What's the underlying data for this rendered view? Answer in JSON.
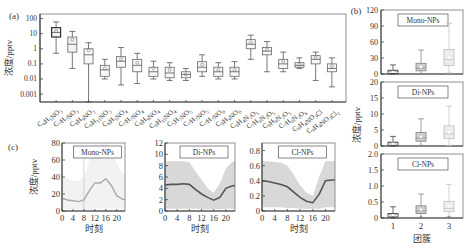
{
  "chart_data": [
    {
      "panel": "(a)",
      "type": "box",
      "ylabel": "浓度/pptv",
      "yscale": "log",
      "yticks": [
        "100",
        "10",
        "1",
        "0.1",
        "0.01",
        "0.001"
      ],
      "ylim": [
        0.0003,
        200
      ],
      "categories": [
        "C6H5NO3",
        "C7H7NO3",
        "C8H9NO3",
        "C6H11NO3",
        "C6H5NO4",
        "C7H7NO4",
        "C8H9NO4",
        "C6H11NO4",
        "C5H7NO5",
        "C7H7NO5",
        "C7H7NO6",
        "C8H9NO6",
        "C6H4N2O5",
        "C7H6N2O5",
        "C8H8N2O5",
        "C7H6N2O6",
        "C6H4NO3Cl",
        "C6H4NO3Cl2"
      ],
      "boxes": [
        {
          "min": 0.5,
          "q1": 6,
          "median": 12,
          "q3": 25,
          "max": 60,
          "mean": 15
        },
        {
          "min": 0.05,
          "q1": 0.6,
          "median": 2,
          "q3": 6,
          "max": 14,
          "mean": 4
        },
        {
          "min": 0.0003,
          "q1": 0.1,
          "median": 0.4,
          "q3": 1,
          "max": 2.5,
          "mean": 0.8
        },
        {
          "min": 0.01,
          "q1": 0.015,
          "median": 0.04,
          "q3": 0.08,
          "max": 0.2,
          "mean": 0.05
        },
        {
          "min": 0.004,
          "q1": 0.06,
          "median": 0.15,
          "q3": 0.3,
          "max": 1.2,
          "mean": 0.2
        },
        {
          "min": 0.005,
          "q1": 0.03,
          "median": 0.08,
          "q3": 0.2,
          "max": 0.5,
          "mean": 0.12
        },
        {
          "min": 0.01,
          "q1": 0.015,
          "median": 0.03,
          "q3": 0.06,
          "max": 0.15,
          "mean": 0.05
        },
        {
          "min": 0.008,
          "q1": 0.012,
          "median": 0.025,
          "q3": 0.06,
          "max": 0.12,
          "mean": 0.04
        },
        {
          "min": 0.008,
          "q1": 0.012,
          "median": 0.02,
          "q3": 0.03,
          "max": 0.05,
          "mean": 0.02
        },
        {
          "min": 0.015,
          "q1": 0.03,
          "median": 0.06,
          "q3": 0.14,
          "max": 0.4,
          "mean": 0.09
        },
        {
          "min": 0.01,
          "q1": 0.015,
          "median": 0.03,
          "q3": 0.06,
          "max": 0.12,
          "mean": 0.04
        },
        {
          "min": 0.01,
          "q1": 0.015,
          "median": 0.03,
          "q3": 0.06,
          "max": 0.14,
          "mean": 0.04
        },
        {
          "min": 0.2,
          "q1": 1,
          "median": 2,
          "q3": 4,
          "max": 8,
          "mean": 2.5
        },
        {
          "min": 0.03,
          "q1": 0.4,
          "median": 0.7,
          "q3": 1.2,
          "max": 3,
          "mean": 0.9
        },
        {
          "min": 0.03,
          "q1": 0.05,
          "median": 0.1,
          "q3": 0.2,
          "max": 0.6,
          "mean": 0.15
        },
        {
          "min": 0.05,
          "q1": 0.06,
          "median": 0.08,
          "q3": 0.12,
          "max": 0.25,
          "mean": 0.09
        },
        {
          "min": 0.008,
          "q1": 0.1,
          "median": 0.2,
          "q3": 0.35,
          "max": 0.6,
          "mean": 0.25
        },
        {
          "min": 0.003,
          "q1": 0.03,
          "median": 0.05,
          "q3": 0.1,
          "max": 0.25,
          "mean": 0.07
        }
      ]
    },
    {
      "panel": "(b)",
      "type": "box",
      "xlabel": "团簇",
      "ylabel": "浓度/pptv",
      "categories": [
        "1",
        "2",
        "3"
      ],
      "subplots": [
        {
          "label": "Mono-NPs",
          "yticks": [
            "0",
            "30",
            "60",
            "90",
            "120"
          ],
          "ylim": [
            0,
            120
          ],
          "boxes": [
            {
              "min": 0,
              "q1": 1,
              "median": 3,
              "q3": 7,
              "max": 17
            },
            {
              "min": 0,
              "q1": 6,
              "median": 11,
              "q3": 20,
              "max": 45
            },
            {
              "min": 2,
              "q1": 16,
              "median": 27,
              "q3": 46,
              "max": 95
            }
          ]
        },
        {
          "label": "Di-NPs",
          "yticks": [
            "0",
            "5",
            "10",
            "15",
            "20"
          ],
          "ylim": [
            0,
            20
          ],
          "boxes": [
            {
              "min": 0,
              "q1": 0.2,
              "median": 0.6,
              "q3": 1.2,
              "max": 3
            },
            {
              "min": 0.2,
              "q1": 1.5,
              "median": 2.5,
              "q3": 4.2,
              "max": 8.5
            },
            {
              "min": 0.2,
              "q1": 2.3,
              "median": 3.8,
              "q3": 6.3,
              "max": 12.5
            }
          ]
        },
        {
          "label": "Cl-NPs",
          "yticks": [
            "0",
            "0.5",
            "1.0",
            "1.5",
            "2.0"
          ],
          "ylim": [
            0,
            2
          ],
          "boxes": [
            {
              "min": 0,
              "q1": 0.03,
              "median": 0.07,
              "q3": 0.14,
              "max": 0.35
            },
            {
              "min": 0.02,
              "q1": 0.14,
              "median": 0.22,
              "q3": 0.38,
              "max": 0.75
            },
            {
              "min": 0.05,
              "q1": 0.2,
              "median": 0.3,
              "q3": 0.52,
              "max": 1.05
            }
          ]
        }
      ]
    },
    {
      "panel": "(c)",
      "type": "line",
      "xlabel": "时刻",
      "ylabel": "浓度/pptv",
      "xticks": [
        "0",
        "4",
        "8",
        "12",
        "16",
        "20"
      ],
      "x": [
        0,
        2,
        4,
        6,
        8,
        10,
        12,
        14,
        16,
        18,
        20,
        22,
        23
      ],
      "subplots": [
        {
          "label": "Mono-NPs",
          "yticks": [
            "0",
            "20",
            "40",
            "60",
            "80"
          ],
          "ylim": [
            0,
            80
          ],
          "mean": [
            15,
            13,
            12,
            11,
            13,
            24,
            33,
            33,
            38,
            30,
            18,
            14,
            13
          ],
          "band_low": [
            2,
            2,
            2,
            2,
            2,
            2,
            3,
            3,
            3,
            3,
            2,
            2,
            2
          ],
          "band_high": [
            40,
            38,
            36,
            35,
            40,
            60,
            78,
            78,
            80,
            75,
            55,
            45,
            42
          ]
        },
        {
          "label": "Di-NPs",
          "yticks": [
            "0",
            "2",
            "4",
            "6",
            "8",
            "10",
            "12"
          ],
          "ylim": [
            0,
            12
          ],
          "mean": [
            4.6,
            4.7,
            4.7,
            4.8,
            4.7,
            3.8,
            3.0,
            2.4,
            1.9,
            2.4,
            4.0,
            4.4,
            4.5
          ],
          "band_low": [
            0.4,
            0.4,
            0.4,
            0.4,
            0.4,
            0.4,
            0.3,
            0.3,
            0.3,
            0.3,
            0.4,
            0.4,
            0.4
          ],
          "band_high": [
            8.8,
            8.8,
            8.8,
            8.8,
            8.6,
            7.0,
            5.5,
            4.0,
            3.2,
            4.8,
            7.5,
            8.6,
            8.8
          ]
        },
        {
          "label": "Cl-NPs",
          "yticks": [
            "0",
            "0.2",
            "0.4",
            "0.6",
            "0.8"
          ],
          "ylim": [
            0,
            0.9
          ],
          "mean": [
            0.4,
            0.39,
            0.37,
            0.35,
            0.32,
            0.25,
            0.18,
            0.13,
            0.11,
            0.22,
            0.4,
            0.41,
            0.41
          ],
          "band_low": [
            0.05,
            0.05,
            0.05,
            0.05,
            0.04,
            0.04,
            0.03,
            0.03,
            0.03,
            0.03,
            0.05,
            0.05,
            0.05
          ],
          "band_high": [
            0.66,
            0.66,
            0.65,
            0.64,
            0.6,
            0.48,
            0.34,
            0.24,
            0.2,
            0.45,
            0.66,
            0.66,
            0.66
          ]
        }
      ]
    }
  ],
  "labels": {
    "panel_a": "(a)",
    "panel_b": "(b)",
    "panel_c": "(c)",
    "ylabel": "浓度/pptv",
    "xlabel_b": "团簇",
    "xlabel_c": "时刻"
  },
  "colors": {
    "c1": "#444444",
    "c2": "#8a8a8a",
    "c3": "#c4c4c4",
    "band": "#d8d8d8",
    "axis": "#444444"
  }
}
